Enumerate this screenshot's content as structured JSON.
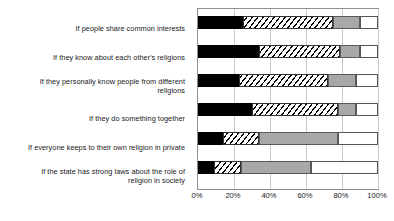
{
  "chart_data": {
    "type": "bar",
    "orientation": "horizontal",
    "stacked": true,
    "stacked_mode": "percent",
    "title": "",
    "subtitle": "",
    "xlabel": "",
    "ylabel": "",
    "grid": true,
    "legend": false,
    "legend_position": "none",
    "xlim": [
      0,
      100
    ],
    "xticks": [
      0,
      20,
      40,
      60,
      80,
      100
    ],
    "xtick_labels": [
      "0%",
      "20%",
      "40%",
      "60%",
      "80%",
      "100%"
    ],
    "categories": [
      "If people share common interests",
      "If they know about each other's religions",
      "If they personally know people from different religions",
      "If they do something together",
      "If everyone keeps to their own religion in private",
      "If the state has strong laws about the role of religion in society"
    ],
    "series": [
      {
        "name": "segment-1",
        "fill": "black",
        "values": [
          25,
          34,
          23,
          30,
          14,
          9
        ]
      },
      {
        "name": "segment-2",
        "fill": "diagonal-hatch",
        "values": [
          50,
          45,
          49,
          48,
          20,
          15
        ]
      },
      {
        "name": "segment-3",
        "fill": "gray",
        "values": [
          15,
          11,
          16,
          10,
          44,
          39
        ]
      },
      {
        "name": "segment-4",
        "fill": "white",
        "values": [
          10,
          10,
          12,
          12,
          22,
          37
        ]
      }
    ],
    "colors": {
      "segment_1": "#000000",
      "segment_2": "#ffffff",
      "segment_3": "#a8a8a8",
      "segment_4": "#ffffff",
      "gridline": "#c9c9c9",
      "axis_border": "#8f8f8f",
      "text": "#1a1a1a"
    }
  },
  "axis": {
    "x_labels": [
      "0%",
      "20%",
      "40%",
      "60%",
      "80%",
      "100%"
    ]
  },
  "categories_wrapped": [
    [
      "If people share common interests"
    ],
    [
      "If they know about each other's religions"
    ],
    [
      "If they personally know people from different",
      "religions"
    ],
    [
      "If they do something together"
    ],
    [
      "If everyone keeps to their own religion in private"
    ],
    [
      "If the state has strong laws about the role of",
      "religion in society"
    ]
  ]
}
